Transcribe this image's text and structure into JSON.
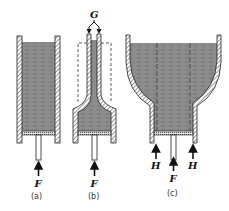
{
  "figure": {
    "type": "hydrostatic-paradox-diagram",
    "colors": {
      "liquid": "#8c8c8c",
      "wall": "#ffffff",
      "outline": "#222222",
      "background": "#ffffff"
    },
    "panels": [
      {
        "id": "a",
        "caption": "(a)",
        "description": "Straight cylinder filled with liquid, piston pushed up by force F",
        "forces": [
          {
            "label": "F",
            "direction": "up"
          }
        ]
      },
      {
        "id": "b",
        "caption": "(b)",
        "description": "Narrow tube above wide base (dashed outline shows cylinder of panel a), force F on piston, forces G on tube walls",
        "forces": [
          {
            "label": "F",
            "direction": "up"
          },
          {
            "label": "G",
            "direction": "up-outward"
          }
        ]
      },
      {
        "id": "c",
        "caption": "(c)",
        "description": "Flared vessel wider at top, piston pushed by F, wall reactions H at bottom",
        "forces": [
          {
            "label": "H",
            "direction": "up"
          },
          {
            "label": "F",
            "direction": "up"
          },
          {
            "label": "H",
            "direction": "up"
          }
        ]
      }
    ]
  }
}
